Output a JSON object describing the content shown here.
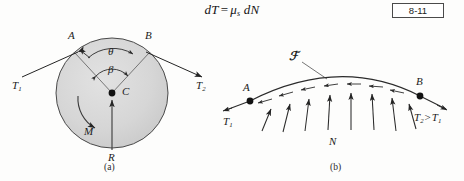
{
  "equation": {
    "lhs": "dT",
    "operator": "=",
    "rhs_mu": "μ",
    "rhs_sub": "s",
    "rhs_tail": "dN",
    "number": "8-11"
  },
  "figure_a": {
    "caption": "(a)",
    "point_a": "A",
    "point_b": "B",
    "center": "C",
    "angle_theta": "θ",
    "angle_beta": "β",
    "tension_left": "T",
    "tension_left_sub": "1",
    "tension_right": "T",
    "tension_right_sub": "2",
    "moment": "M",
    "reaction": "R"
  },
  "figure_b": {
    "caption": "(b)",
    "point_a": "A",
    "point_b": "B",
    "friction": "ℱ",
    "normal": "N",
    "tension_left": "T",
    "tension_left_sub": "1",
    "tension_right": "T",
    "tension_right_sub": "2",
    "comparison": ">",
    "tension_compare": "T",
    "tension_compare_sub": "1"
  },
  "colors": {
    "ink": "#1b1b1b",
    "disk_fill": "#d9d9d9",
    "disk_stroke": "#3a3a3a",
    "arrow": "#2a2a2a",
    "box_border": "#4a4a4a"
  }
}
